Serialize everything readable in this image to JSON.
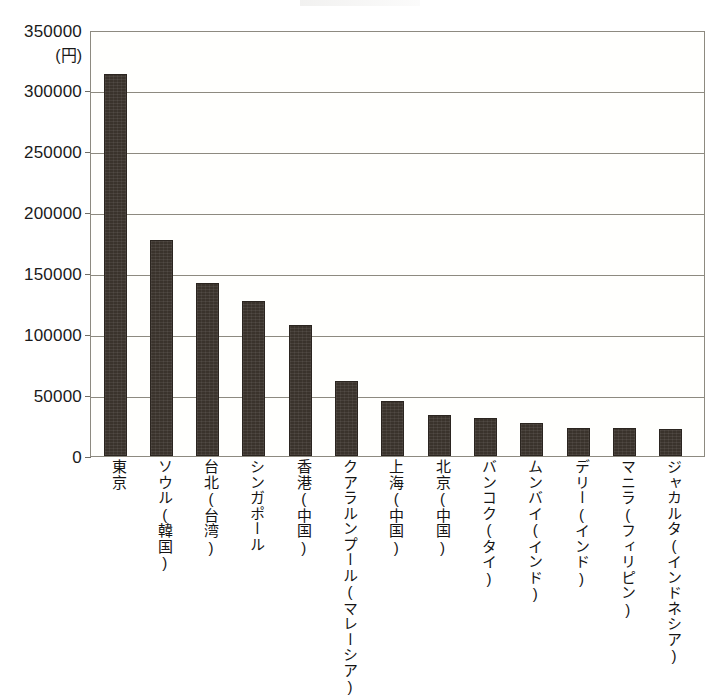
{
  "chart_data": {
    "type": "bar",
    "title": "",
    "xlabel": "",
    "ylabel": "",
    "unit_label": "(円)",
    "ylim": [
      0,
      350000
    ],
    "ytick_step": 50000,
    "grid": true,
    "legend": "none",
    "bar_color": "#3a332c",
    "categories": [
      "東京",
      "ソウル(韓国)",
      "台北(台湾)",
      "シンガポール",
      "香港(中国)",
      "クアラルンプール(マレーシア)",
      "上海(中国)",
      "北京(中国)",
      "バンコク(タイ)",
      "ムンバイ(インド)",
      "デリー(インド)",
      "マニラ(フィリピン)",
      "ジャカルタ(インドネシア)"
    ],
    "values": [
      315000,
      178000,
      143000,
      128000,
      108000,
      62000,
      45000,
      34000,
      31000,
      27000,
      23000,
      23000,
      22000
    ],
    "yticks": [
      {
        "value": 350000,
        "label": "350000"
      },
      {
        "value": 300000,
        "label": "300000"
      },
      {
        "value": 250000,
        "label": "250000"
      },
      {
        "value": 200000,
        "label": "200000"
      },
      {
        "value": 150000,
        "label": "150000"
      },
      {
        "value": 100000,
        "label": "100000"
      },
      {
        "value": 50000,
        "label": "50000"
      },
      {
        "value": 0,
        "label": "0"
      }
    ]
  },
  "footer": {
    "cropped_text": ""
  }
}
